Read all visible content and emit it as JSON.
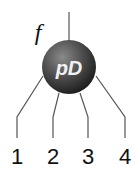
{
  "diagram": {
    "function_label": "f",
    "node_label": "pD",
    "node_color": "#4a4a4a",
    "line_color": "#555555",
    "legs": [
      {
        "label": "1"
      },
      {
        "label": "2"
      },
      {
        "label": "3"
      },
      {
        "label": "4"
      }
    ]
  }
}
